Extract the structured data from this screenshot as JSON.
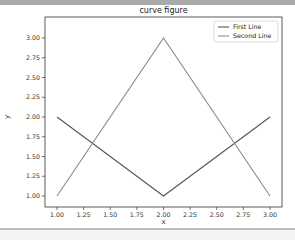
{
  "chart_data": {
    "type": "line",
    "title": "curve figure",
    "xlabel": "x",
    "ylabel": "y",
    "x": [
      1,
      2,
      3
    ],
    "series": [
      {
        "name": "First Line",
        "values": [
          2,
          1,
          2
        ],
        "color": "#555555"
      },
      {
        "name": "Second Line",
        "values": [
          1,
          3,
          1
        ],
        "color": "#8a8a8a"
      }
    ],
    "xlim": [
      0.9,
      3.1
    ],
    "ylim": [
      0.9,
      3.1
    ],
    "xticks": [
      "1.00",
      "1.25",
      "1.50",
      "1.75",
      "2.00",
      "2.25",
      "2.50",
      "2.75",
      "3.00"
    ],
    "yticks": [
      "1.00",
      "1.25",
      "1.50",
      "1.75",
      "2.00",
      "2.25",
      "2.50",
      "2.75",
      "3.00"
    ],
    "grid": false,
    "legend_position": "upper right"
  }
}
